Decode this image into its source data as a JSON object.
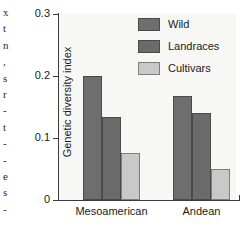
{
  "margin_text_fragments": [
    "x",
    "t",
    "n",
    ",",
    "s",
    "r",
    "-",
    "t",
    "-",
    "-",
    "e",
    "s",
    "-"
  ],
  "chart_data": {
    "type": "bar",
    "title": "",
    "xlabel": "",
    "ylabel": "Genetic diversity index",
    "categories": [
      "Mesoamerican",
      "Andean"
    ],
    "series": [
      {
        "name": "Wild",
        "values": [
          0.2,
          0.168
        ],
        "color": "#6e6e6e"
      },
      {
        "name": "Landraces",
        "values": [
          0.134,
          0.14
        ],
        "color": "#6b6b6b"
      },
      {
        "name": "Cultivars",
        "values": [
          0.076,
          0.05
        ],
        "color": "#c9c9c9"
      }
    ],
    "ylim": [
      0,
      0.3
    ],
    "yticks": [
      "0",
      "0.1",
      "0.2",
      "0.3"
    ],
    "ytick_values": [
      0,
      0.1,
      0.2,
      0.3
    ],
    "grid": false,
    "legend_position": "top-right"
  }
}
